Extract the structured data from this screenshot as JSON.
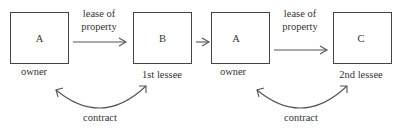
{
  "diagram": {
    "nodes": [
      {
        "id": "A1",
        "label": "A",
        "caption": "owner"
      },
      {
        "id": "B",
        "label": "B",
        "caption": "1st lessee"
      },
      {
        "id": "A2",
        "label": "A",
        "caption": "owner"
      },
      {
        "id": "C",
        "label": "C",
        "caption": "2nd lessee"
      }
    ],
    "edges": [
      {
        "from": "A1",
        "to": "B",
        "label_line1": "lease of",
        "label_line2": "property"
      },
      {
        "from": "B",
        "to": "A2",
        "label_line1": "",
        "label_line2": ""
      },
      {
        "from": "A2",
        "to": "C",
        "label_line1": "lease of",
        "label_line2": "property"
      }
    ],
    "contracts": [
      {
        "between": [
          "A1",
          "B"
        ],
        "label": "contract"
      },
      {
        "between": [
          "A2",
          "C"
        ],
        "label": "contract"
      }
    ]
  }
}
